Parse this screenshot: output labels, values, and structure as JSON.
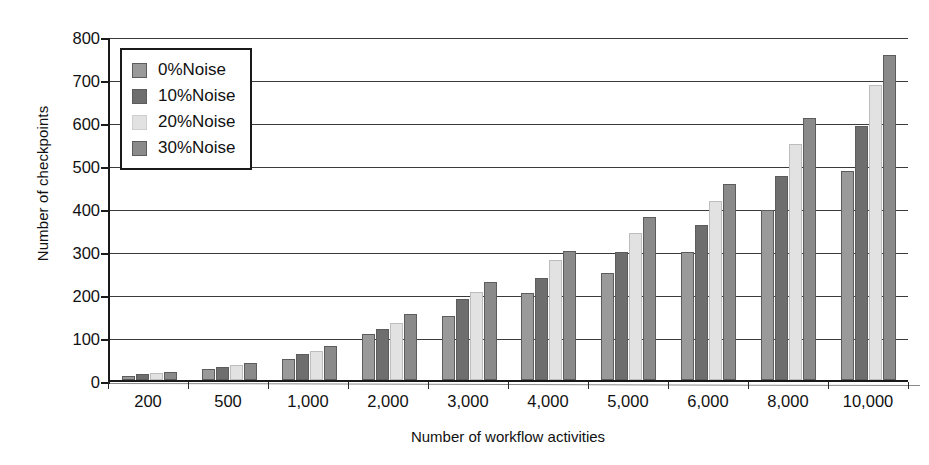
{
  "chart_data": {
    "type": "bar",
    "title": "",
    "xlabel": "Number of workflow activities",
    "ylabel": "Number of checkpoints",
    "categories": [
      "200",
      "500",
      "1,000",
      "2,000",
      "3,000",
      "4,000",
      "5,000",
      "6,000",
      "8,000",
      "10,000"
    ],
    "ylim": [
      0,
      800
    ],
    "yticks": [
      0,
      100,
      200,
      300,
      400,
      500,
      600,
      700,
      800
    ],
    "ytick_labels": [
      "0",
      "100",
      "200",
      "300",
      "400",
      "500",
      "600",
      "700",
      "800"
    ],
    "grid": true,
    "legend_position": "upper-left-inside",
    "series": [
      {
        "name": "0%Noise",
        "color": "#9a9a9a",
        "values": [
          10,
          26,
          50,
          108,
          150,
          203,
          250,
          297,
          395,
          485
        ]
      },
      {
        "name": "10%Noise",
        "color": "#6e6e6e",
        "values": [
          14,
          31,
          60,
          118,
          188,
          237,
          297,
          360,
          475,
          590
        ]
      },
      {
        "name": "20%Noise",
        "color": "#e2e2e2",
        "values": [
          16,
          35,
          68,
          133,
          205,
          280,
          343,
          417,
          550,
          685
        ]
      },
      {
        "name": "30%Noise",
        "color": "#8a8a8a",
        "values": [
          18,
          40,
          78,
          153,
          228,
          300,
          380,
          455,
          610,
          755
        ]
      }
    ]
  }
}
